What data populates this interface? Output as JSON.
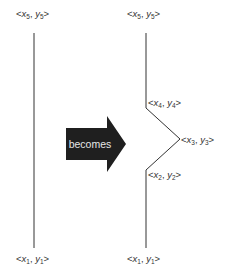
{
  "diagram": {
    "arrow_label": "becomes",
    "colors": {
      "line": "#333333",
      "arrow_fill": "#1f1f1f",
      "arrow_text": "#e6e6e6",
      "background": "#ffffff"
    },
    "left_line": {
      "top_label": {
        "x": "x",
        "y": "y",
        "sub": "5"
      },
      "bottom_label": {
        "x": "x",
        "y": "y",
        "sub": "1"
      }
    },
    "right_line": {
      "labels": [
        {
          "id": "p5",
          "x": "x",
          "y": "y",
          "sub": "5"
        },
        {
          "id": "p4",
          "x": "x",
          "y": "y",
          "sub": "4"
        },
        {
          "id": "p3",
          "x": "x",
          "y": "y",
          "sub": "3"
        },
        {
          "id": "p2",
          "x": "x",
          "y": "y",
          "sub": "2"
        },
        {
          "id": "p1",
          "x": "x",
          "y": "y",
          "sub": "1"
        }
      ]
    },
    "punct": {
      "open": "<",
      "comma": ", ",
      "close": ">"
    }
  }
}
